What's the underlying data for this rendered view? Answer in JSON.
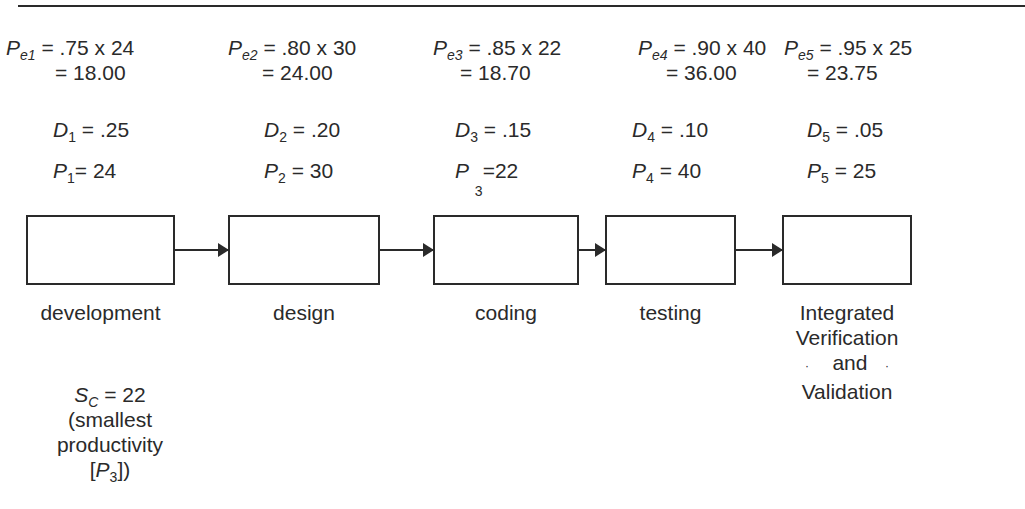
{
  "diagram": {
    "stages": [
      {
        "name": "development",
        "pe_label": "P",
        "pe_sub": "e1",
        "pe_expr": "= .75 x 24",
        "pe_result": "= 18.00",
        "d_label": "D",
        "d_sub": "1",
        "d_value": "= .25",
        "p_label": "P",
        "p_sub": "1",
        "p_value": "= 24"
      },
      {
        "name": "design",
        "pe_label": "P",
        "pe_sub": "e2",
        "pe_expr": "= .80 x 30",
        "pe_result": "= 24.00",
        "d_label": "D",
        "d_sub": "2",
        "d_value": "= .20",
        "p_label": "P",
        "p_sub": "2",
        "p_value": "= 30"
      },
      {
        "name": "coding",
        "pe_label": "P",
        "pe_sub": "e3",
        "pe_expr": "= .85 x 22",
        "pe_result": "= 18.70",
        "d_label": "D",
        "d_sub": "3",
        "d_value": "= .15",
        "p_label": "P",
        "p_sub": "3",
        "p_value": "=22"
      },
      {
        "name": "testing",
        "pe_label": "P",
        "pe_sub": "e4",
        "pe_expr": "= .90 x 40",
        "pe_result": "= 36.00",
        "d_label": "D",
        "d_sub": "4",
        "d_value": "= .10",
        "p_label": "P",
        "p_sub": "4",
        "p_value": "= 40"
      },
      {
        "name_lines": [
          "Integrated",
          "Verification",
          "and",
          "Validation"
        ],
        "pe_label": "P",
        "pe_sub": "e5",
        "pe_expr": "= .95 x 25",
        "pe_result": "= 23.75",
        "d_label": "D",
        "d_sub": "5",
        "d_value": "= .05",
        "p_label": "P",
        "p_sub": "5",
        "p_value": "= 25"
      }
    ],
    "note": {
      "sc_label": "S",
      "sc_sub": "C",
      "sc_value": "= 22",
      "line2": "(smallest",
      "line3": "productivity",
      "line4_open": "[",
      "line4_label": "P",
      "line4_sub": "3",
      "line4_close": "])"
    },
    "colors": {
      "ink": "#2a2a2a",
      "background": "#ffffff"
    }
  }
}
